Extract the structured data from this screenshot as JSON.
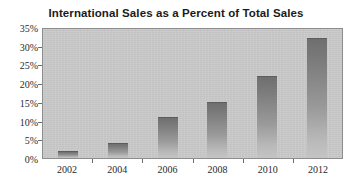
{
  "chart_data": {
    "type": "bar",
    "title": "International Sales as a Percent of Total Sales",
    "xlabel": "",
    "ylabel": "",
    "categories": [
      "2002",
      "2004",
      "2006",
      "2008",
      "2010",
      "2012"
    ],
    "values": [
      2,
      4,
      11,
      15,
      22,
      32
    ],
    "ylim": [
      0,
      35
    ],
    "ytick_labels": [
      "35%",
      "30%",
      "25%",
      "20%",
      "15%",
      "10%",
      "5%",
      "0%"
    ],
    "ytick_values": [
      35,
      30,
      25,
      20,
      15,
      10,
      5,
      0
    ],
    "grid": false,
    "legend": false,
    "bar_color": "#8a8a8a",
    "plot_background": "#c9c9c9",
    "axis_color": "#8d8d8d",
    "title_color": "#1b1b1b"
  }
}
